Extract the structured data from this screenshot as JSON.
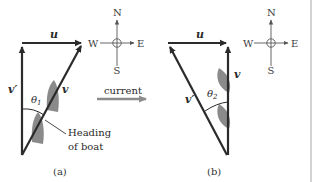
{
  "figure": {
    "panels": [
      {
        "id": "a",
        "caption": "(a)",
        "vectors": {
          "u": "u",
          "v": "v",
          "v_prime": "v′"
        },
        "angle_label": "θ",
        "angle_subscript": "1",
        "annotation_line1": "Heading",
        "annotation_line2": "of boat",
        "compass": {
          "north": "N",
          "south": "S",
          "east": "E",
          "west": "W"
        }
      },
      {
        "id": "b",
        "caption": "(b)",
        "vectors": {
          "u": "u",
          "v": "v",
          "v_prime": "v′"
        },
        "angle_label": "θ",
        "angle_subscript": "2",
        "compass": {
          "north": "N",
          "south": "S",
          "east": "E",
          "west": "W"
        }
      }
    ],
    "current_label": "current",
    "colors": {
      "vector": "#2b2b2b",
      "boat": "#8a8a8a",
      "current_arrow": "#8c8c8c",
      "compass": "#555555",
      "divider": "#b5b5b5"
    }
  }
}
